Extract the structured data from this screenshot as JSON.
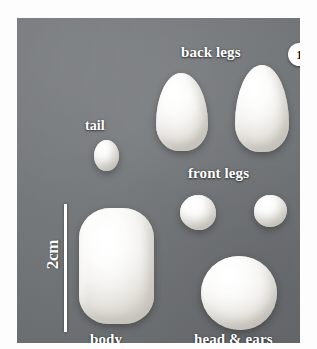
{
  "figure": {
    "panel_label": "1",
    "background_color": "#74777a",
    "clay_color": "#f7f6f3",
    "label_color": "#ffffff"
  },
  "scale": {
    "text": "2cm",
    "orientation": "vertical"
  },
  "labels": {
    "back_legs": "back legs",
    "tail": "tail",
    "front_legs": "front legs",
    "body": "body",
    "head_and_ears": "head & ears"
  },
  "pieces": [
    {
      "name": "back-leg-left",
      "group": "back legs",
      "shape": "teardrop"
    },
    {
      "name": "back-leg-right",
      "group": "back legs",
      "shape": "teardrop"
    },
    {
      "name": "tail",
      "group": "tail",
      "shape": "oval"
    },
    {
      "name": "front-leg-left",
      "group": "front legs",
      "shape": "ball"
    },
    {
      "name": "front-leg-right",
      "group": "front legs",
      "shape": "ball"
    },
    {
      "name": "body",
      "group": "body",
      "shape": "rounded-block"
    },
    {
      "name": "head-and-ears",
      "group": "head & ears",
      "shape": "ball"
    }
  ]
}
